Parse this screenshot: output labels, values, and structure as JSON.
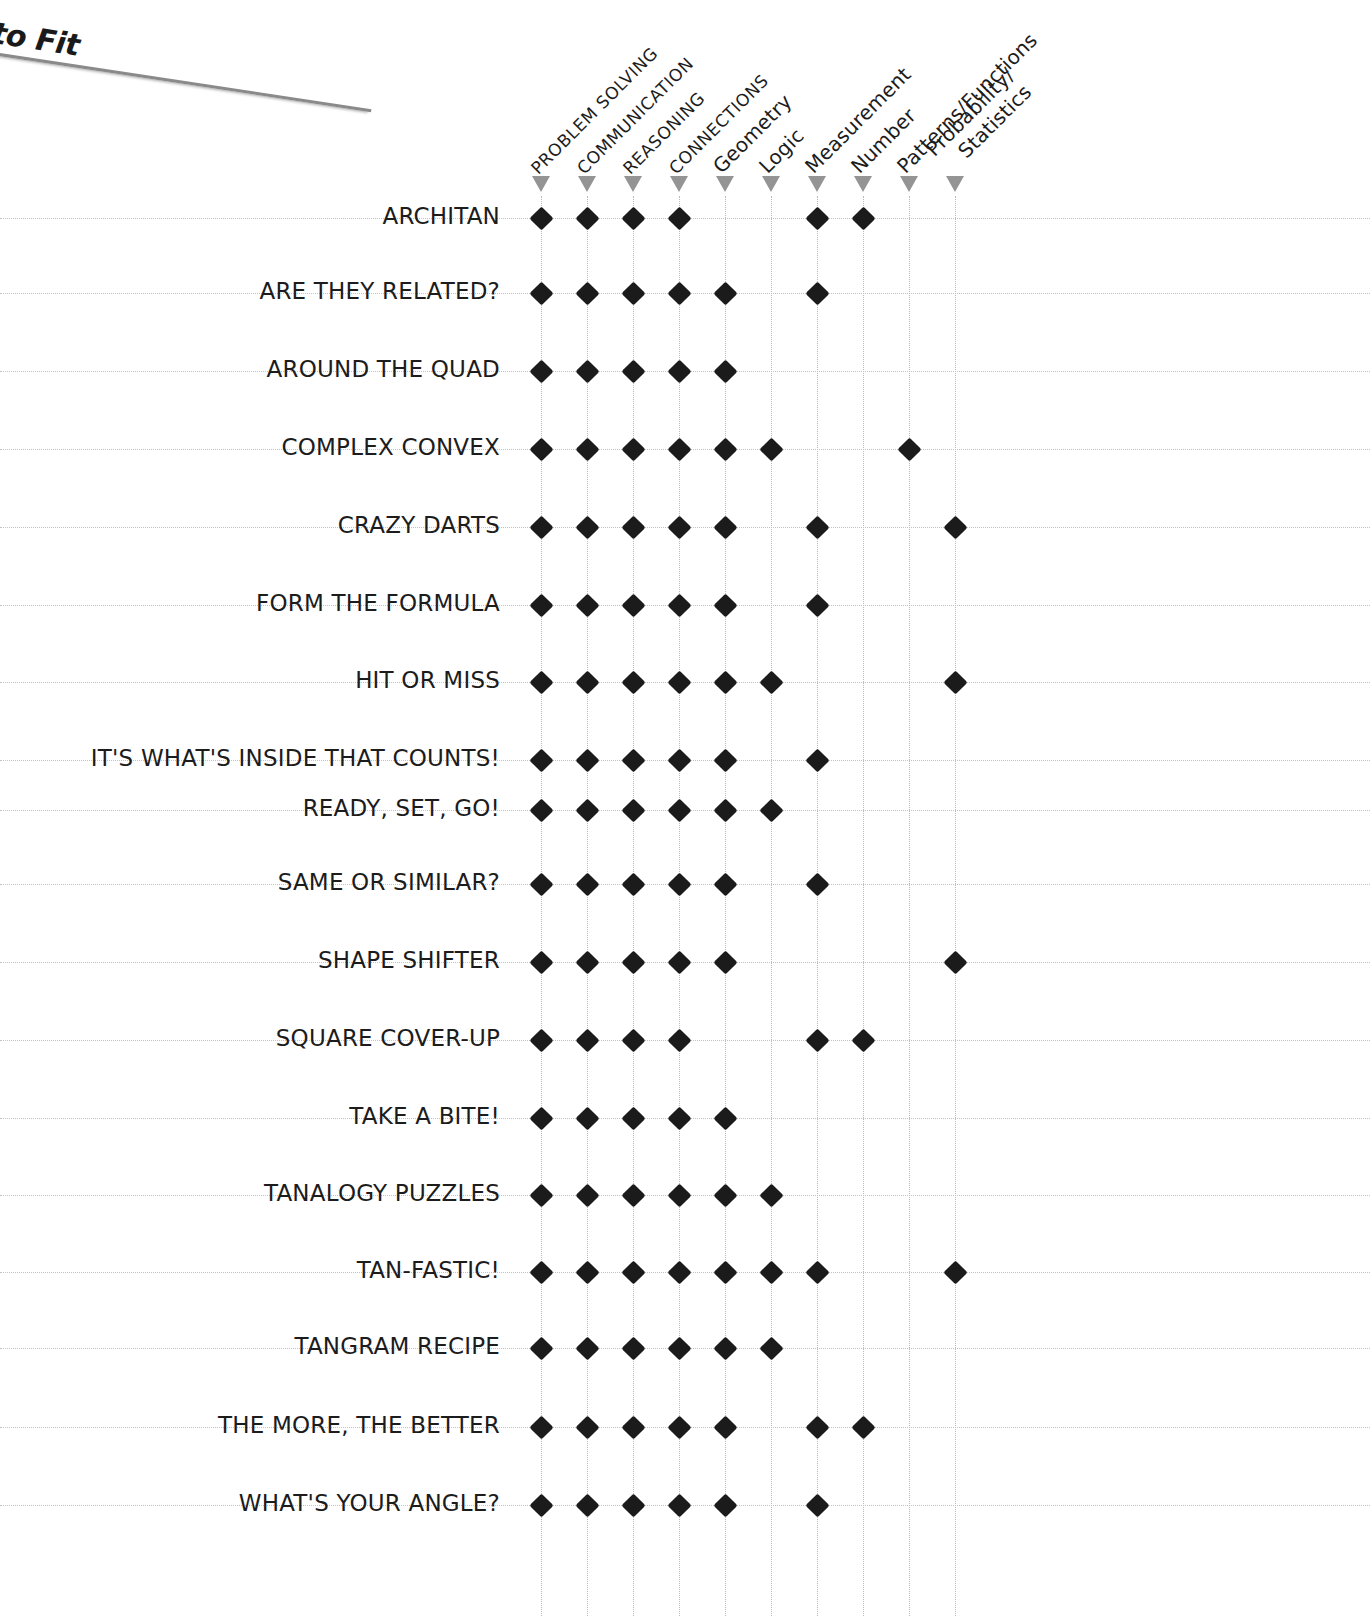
{
  "banner": {
    "text": "to Fit",
    "icon": "folded-page-corner"
  },
  "chart_data": {
    "type": "heatmap",
    "title": "",
    "xlabel": "",
    "ylabel": "",
    "legend": "",
    "grid": true,
    "marker_glyph": "filled-diamond",
    "column_marker_glyph": "down-triangle",
    "columns": [
      {
        "label": "PROBLEM SOLVING",
        "style": "upper"
      },
      {
        "label": "COMMUNICATION",
        "style": "upper"
      },
      {
        "label": "REASONING",
        "style": "upper"
      },
      {
        "label": "CONNECTIONS",
        "style": "upper"
      },
      {
        "label": "Geometry",
        "style": "title"
      },
      {
        "label": "Logic",
        "style": "title"
      },
      {
        "label": "Measurement",
        "style": "title"
      },
      {
        "label": "Number",
        "style": "title"
      },
      {
        "label": "Patterns/Functions",
        "style": "title"
      },
      {
        "label": "Probability/",
        "label2": "Statistics",
        "style": "title"
      }
    ],
    "categories": [
      "ARCHITAN",
      "ARE THEY RELATED?",
      "AROUND THE QUAD",
      "COMPLEX CONVEX",
      "CRAZY DARTS",
      "FORM THE FORMULA",
      "HIT OR MISS",
      "IT'S WHAT'S INSIDE THAT COUNTS!",
      "READY, SET, GO!",
      "SAME OR SIMILAR?",
      "SHAPE SHIFTER",
      "SQUARE COVER-UP",
      "TAKE A BITE!",
      "TANALOGY PUZZLES",
      "TAN-FASTIC!",
      "TANGRAM RECIPE",
      "THE MORE, THE BETTER",
      "WHAT'S YOUR ANGLE?"
    ],
    "values": [
      [
        1,
        1,
        1,
        1,
        0,
        0,
        1,
        1,
        0,
        0
      ],
      [
        1,
        1,
        1,
        1,
        1,
        0,
        1,
        0,
        0,
        0
      ],
      [
        1,
        1,
        1,
        1,
        1,
        0,
        0,
        0,
        0,
        0
      ],
      [
        1,
        1,
        1,
        1,
        1,
        1,
        0,
        0,
        1,
        0
      ],
      [
        1,
        1,
        1,
        1,
        1,
        0,
        1,
        0,
        0,
        1
      ],
      [
        1,
        1,
        1,
        1,
        1,
        0,
        1,
        0,
        0,
        0
      ],
      [
        1,
        1,
        1,
        1,
        1,
        1,
        0,
        0,
        0,
        1
      ],
      [
        1,
        1,
        1,
        1,
        1,
        0,
        1,
        0,
        0,
        0
      ],
      [
        1,
        1,
        1,
        1,
        1,
        1,
        0,
        0,
        0,
        0
      ],
      [
        1,
        1,
        1,
        1,
        1,
        0,
        1,
        0,
        0,
        0
      ],
      [
        1,
        1,
        1,
        1,
        1,
        0,
        0,
        0,
        0,
        1
      ],
      [
        1,
        1,
        1,
        1,
        0,
        0,
        1,
        1,
        0,
        0
      ],
      [
        1,
        1,
        1,
        1,
        1,
        0,
        0,
        0,
        0,
        0
      ],
      [
        1,
        1,
        1,
        1,
        1,
        1,
        0,
        0,
        0,
        0
      ],
      [
        1,
        1,
        1,
        1,
        1,
        1,
        1,
        0,
        0,
        1
      ],
      [
        1,
        1,
        1,
        1,
        1,
        1,
        0,
        0,
        0,
        0
      ],
      [
        1,
        1,
        1,
        1,
        1,
        0,
        1,
        1,
        0,
        0
      ],
      [
        1,
        1,
        1,
        1,
        1,
        0,
        1,
        0,
        0,
        0
      ]
    ]
  },
  "colors": {
    "marker": "#1b1b1b",
    "column_marker": "#949494",
    "grid": "#c2c2c2",
    "text": "#1c1c1c",
    "background": "#ffffff"
  },
  "layout": {
    "column_x": [
      541,
      587,
      633,
      679,
      725,
      771,
      817,
      863,
      909,
      955
    ],
    "row_y": [
      218,
      293,
      371,
      449,
      527,
      605,
      682,
      760,
      810,
      884,
      962,
      1040,
      1118,
      1195,
      1272,
      1348,
      1427,
      1505
    ],
    "row_label_right": 500
  }
}
